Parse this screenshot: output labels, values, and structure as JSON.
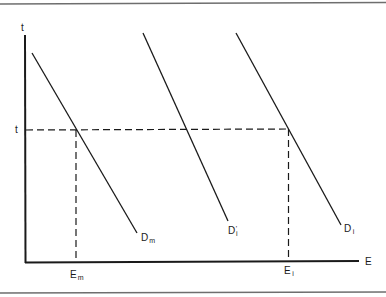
{
  "diagram": {
    "axes": {
      "y_label": "t",
      "x_label": "E"
    },
    "reference": {
      "t_level_label": "t",
      "x_markers": [
        {
          "main": "E",
          "sub": "m"
        },
        {
          "main": "E",
          "sub": "i"
        }
      ]
    },
    "curves": [
      {
        "main": "D",
        "sub": "m",
        "prime": ""
      },
      {
        "main": "D",
        "sub": "i",
        "prime": "'"
      },
      {
        "main": "D",
        "sub": "i",
        "prime": ""
      }
    ],
    "colors": {
      "line": "#1a1a1a",
      "border": "#6e6e6e",
      "background": "#ffffff"
    }
  }
}
